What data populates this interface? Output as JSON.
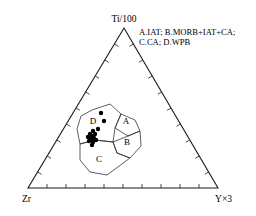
{
  "figure": {
    "background_color": "#ffffff",
    "line_color": "#1a1a1a",
    "point_color": "#000000"
  },
  "vertices": {
    "top_label": "Ti/100",
    "bottom_left_label": "Zr",
    "bottom_right_label": "Y×3"
  },
  "legend": {
    "line1": "A.IAT; B.MORB+IAT+CA;",
    "line2": "C.CA; D.WPB"
  },
  "field_labels": {
    "a": "A",
    "b": "B",
    "c": "C",
    "d": "D"
  },
  "chart_data": {
    "type": "scatter",
    "projection": "ternary",
    "xlabel": "",
    "ylabel": "",
    "grid": false,
    "legend_position": "top-right",
    "axes": [
      {
        "name": "Ti/100",
        "vertex": "top",
        "ticks": 10
      },
      {
        "name": "Zr",
        "vertex": "bottom-left",
        "ticks": 10
      },
      {
        "name": "Y×3",
        "vertex": "bottom-right",
        "ticks": 10
      }
    ],
    "triangle_pixels": {
      "top": [
        124,
        28
      ],
      "bottom_left": [
        28,
        188
      ],
      "bottom_right": [
        218,
        188
      ]
    },
    "legend_entries": [
      {
        "key": "A",
        "label": "IAT"
      },
      {
        "key": "B",
        "label": "MORB+IAT+CA"
      },
      {
        "key": "C",
        "label": "CA"
      },
      {
        "key": "D",
        "label": "WPB"
      }
    ],
    "fields": [
      {
        "key": "A",
        "label": "IAT",
        "label_pixel": [
          126,
          122
        ],
        "polygon_pixels": [
          [
            115,
            128
          ],
          [
            121,
            114
          ],
          [
            135,
            120
          ],
          [
            140,
            131
          ],
          [
            128,
            136
          ]
        ]
      },
      {
        "key": "B",
        "label": "MORB+IAT+CA",
        "label_pixel": [
          127,
          143
        ],
        "polygon_pixels": [
          [
            113,
            142
          ],
          [
            128,
            136
          ],
          [
            140,
            131
          ],
          [
            141,
            146
          ],
          [
            130,
            158
          ],
          [
            117,
            153
          ]
        ]
      },
      {
        "key": "C",
        "label": "CA",
        "label_pixel": [
          99,
          160
        ],
        "polygon_pixels": [
          [
            80,
            144
          ],
          [
            95,
            140
          ],
          [
            113,
            142
          ],
          [
            117,
            153
          ],
          [
            130,
            158
          ],
          [
            107,
            175
          ],
          [
            90,
            172
          ],
          [
            80,
            160
          ]
        ]
      },
      {
        "key": "D",
        "label": "WPB",
        "label_pixel": [
          93,
          122
        ],
        "polygon_pixels": [
          [
            92,
            110
          ],
          [
            110,
            104
          ],
          [
            121,
            114
          ],
          [
            115,
            128
          ],
          [
            113,
            142
          ],
          [
            95,
            140
          ],
          [
            80,
            144
          ],
          [
            77,
            129
          ],
          [
            81,
            116
          ]
        ]
      }
    ],
    "series": [
      {
        "name": "samples",
        "marker": "filled-circle",
        "color": "#000000",
        "count": 14,
        "points_pixels": [
          [
            101,
            113
          ],
          [
            104,
            121
          ],
          [
            98,
            129
          ],
          [
            93,
            131
          ],
          [
            90,
            134
          ],
          [
            92,
            136
          ],
          [
            95,
            134
          ],
          [
            88,
            137
          ],
          [
            91,
            139
          ],
          [
            94,
            138
          ],
          [
            89,
            141
          ],
          [
            93,
            142
          ],
          [
            96,
            140
          ],
          [
            92,
            145
          ]
        ]
      }
    ]
  }
}
